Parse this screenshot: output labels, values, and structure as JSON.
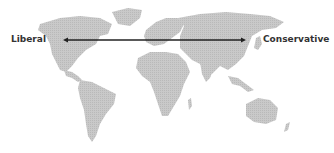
{
  "diagram": {
    "type": "world-map-spectrum",
    "left_label": "Liberal",
    "right_label": "Conservative",
    "arrow": {
      "direction": "bidirectional",
      "color": "#222222"
    },
    "map_color": "#c4c4c4"
  }
}
